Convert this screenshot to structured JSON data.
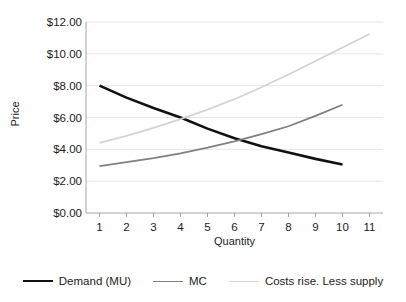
{
  "chart_data": {
    "type": "line",
    "title": "",
    "xlabel": "Quantity",
    "ylabel": "Price",
    "x": [
      1,
      2,
      3,
      4,
      5,
      6,
      7,
      8,
      9,
      10,
      11
    ],
    "xlim": [
      0.5,
      11.5
    ],
    "ylim": [
      0,
      12
    ],
    "yticks": [
      0,
      2,
      4,
      6,
      8,
      10,
      12
    ],
    "ytick_labels": [
      "$0.00",
      "$2.00",
      "$4.00",
      "$6.00",
      "$8.00",
      "$10.00",
      "$12.00"
    ],
    "xtick_labels": [
      "1",
      "2",
      "3",
      "4",
      "5",
      "6",
      "7",
      "8",
      "9",
      "10",
      "11"
    ],
    "grid": "horizontal",
    "legend_position": "bottom",
    "series": [
      {
        "name": "Demand (MU)",
        "color": "#111111",
        "width": 2.6,
        "x": [
          1,
          2,
          3,
          4,
          5,
          6,
          7,
          8,
          9,
          10
        ],
        "values": [
          8.0,
          7.25,
          6.6,
          6.0,
          5.3,
          4.7,
          4.2,
          3.8,
          3.4,
          3.05
        ]
      },
      {
        "name": "MC",
        "color": "#808080",
        "width": 1.8,
        "x": [
          1,
          2,
          3,
          4,
          5,
          6,
          7,
          8,
          9,
          10
        ],
        "values": [
          2.95,
          3.2,
          3.45,
          3.75,
          4.1,
          4.5,
          4.95,
          5.45,
          6.1,
          6.8
        ]
      },
      {
        "name": "Costs rise. Less supply",
        "color": "#d4d4d4",
        "width": 1.8,
        "x": [
          1,
          2,
          3,
          4,
          5,
          6,
          7,
          8,
          9,
          10,
          11
        ],
        "values": [
          4.4,
          4.85,
          5.35,
          5.9,
          6.5,
          7.15,
          7.9,
          8.7,
          9.55,
          10.4,
          11.25
        ]
      }
    ],
    "colors": {
      "demand": "#111111",
      "mc": "#808080",
      "costs_rise": "#d4d4d4",
      "grid": "#e6e6e6",
      "axis": "#a6a6a6",
      "text": "#1c1c1c",
      "background": "#ffffff"
    }
  },
  "legend": {
    "items": [
      {
        "label": "Demand (MU)"
      },
      {
        "label": "MC"
      },
      {
        "label": "Costs rise. Less supply"
      }
    ]
  }
}
